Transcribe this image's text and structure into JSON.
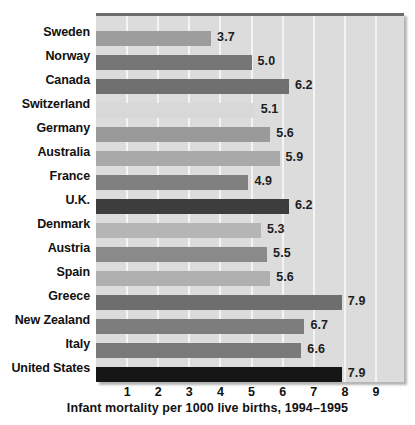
{
  "chart_data": {
    "type": "bar",
    "orientation": "horizontal",
    "title": "",
    "xlabel": "Infant mortality per 1000 live births, 1994–1995",
    "ylabel": "",
    "xlim": [
      0,
      9.9
    ],
    "grid": true,
    "legend": null,
    "xticks": [
      1,
      2,
      3,
      4,
      5,
      6,
      7,
      8,
      9
    ],
    "xtick_labels": [
      "1",
      "2",
      "3",
      "4",
      "5",
      "6",
      "7",
      "8",
      "9"
    ],
    "categories": [
      "Sweden",
      "Norway",
      "Canada",
      "Switzerland",
      "Germany",
      "Australia",
      "France",
      "U.K.",
      "Denmark",
      "Austria",
      "Spain",
      "Greece",
      "New Zealand",
      "Italy",
      "United States"
    ],
    "values": [
      3.7,
      5.0,
      6.2,
      5.1,
      5.6,
      5.9,
      4.9,
      6.2,
      5.3,
      5.5,
      5.6,
      7.9,
      6.7,
      6.6,
      7.9
    ],
    "value_labels": [
      "3.7",
      "5.0",
      "6.2",
      "5.1",
      "5.6",
      "5.9",
      "4.9",
      "6.2",
      "5.3",
      "5.5",
      "5.6",
      "7.9",
      "6.7",
      "6.6",
      "7.9"
    ],
    "bar_colors": [
      "#9d9d9d",
      "#767676",
      "#707070",
      "#d8d8d8",
      "#9a9a9a",
      "#a9a9a9",
      "#808080",
      "#3d3d3d",
      "#b5b5b5",
      "#8a8a8a",
      "#b0b0b0",
      "#6e6e6e",
      "#7d7d7d",
      "#7a7a7a",
      "#161616"
    ]
  },
  "style": {
    "plot_background": "#dcdcdc",
    "gridline_color": "#f4f4f4",
    "page_background": "#ffffff",
    "text_color": "#111111",
    "top_border_color": "#6b6b6b"
  }
}
